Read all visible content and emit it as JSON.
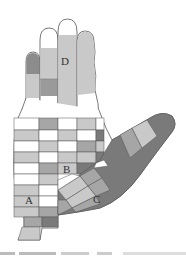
{
  "figure": {
    "labels": [
      {
        "id": "D",
        "text": "D",
        "x": 61,
        "y": 65
      },
      {
        "id": "B",
        "text": "B",
        "x": 63,
        "y": 173
      },
      {
        "id": "A",
        "text": "A",
        "x": 25,
        "y": 204
      },
      {
        "id": "C",
        "text": "C",
        "x": 93,
        "y": 203
      }
    ],
    "colors": {
      "white": "#ffffff",
      "light": "#c9c9c9",
      "mid": "#a6a6a6",
      "dark": "#7a7a7a",
      "outline": "#555555"
    },
    "grid": {
      "columns_x": [
        14,
        39,
        58,
        77,
        96,
        104
      ],
      "rows": [
        {
          "y": 118,
          "h": 12,
          "cells": [
            "white",
            "mid",
            "white",
            "light",
            "white"
          ]
        },
        {
          "y": 130,
          "h": 11,
          "cells": [
            "light",
            "white",
            "light",
            "white",
            "dark"
          ]
        },
        {
          "y": 141,
          "h": 11,
          "cells": [
            "white",
            "light",
            "white",
            "mid",
            "light"
          ]
        },
        {
          "y": 152,
          "h": 11,
          "cells": [
            "light",
            "white",
            "light",
            "light",
            "dark"
          ]
        },
        {
          "y": 163,
          "h": 11,
          "cells": [
            "white",
            "mid",
            "light",
            "dark",
            null
          ]
        },
        {
          "y": 174,
          "h": 11,
          "cells": [
            "white",
            "light",
            null,
            null,
            null
          ]
        },
        {
          "y": 185,
          "h": 11,
          "cells": [
            "light",
            "white",
            null,
            null,
            null
          ]
        },
        {
          "y": 196,
          "h": 11,
          "cells": [
            "light",
            "white",
            null,
            null,
            null
          ]
        },
        {
          "y": 207,
          "h": 10,
          "cells": [
            "light",
            "mid",
            null,
            null,
            null
          ]
        }
      ]
    },
    "caption_text": ""
  }
}
